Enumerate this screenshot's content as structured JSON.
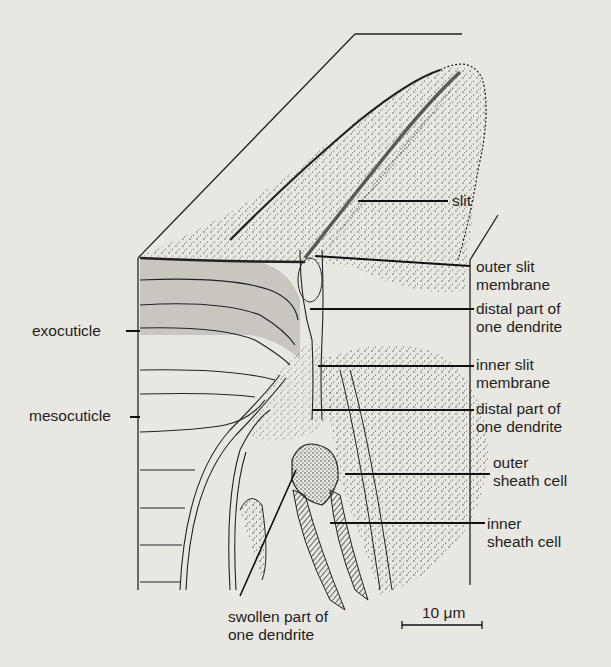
{
  "figure": {
    "colors": {
      "background": "#e9e7e2",
      "ink": "#1e1e1e",
      "exocuticle_fill": "#c9c6c0",
      "stipple": "#2a2a2a"
    }
  },
  "labels": {
    "slit": "slit",
    "outer_slit_membrane": "outer slit\nmembrane",
    "distal_part_1": "distal part of\none dendrite",
    "inner_slit_membrane": "inner slit\nmembrane",
    "distal_part_2": "distal part of\none dendrite",
    "outer_sheath_cell": "outer\nsheath cell",
    "inner_sheath_cell": "inner\nsheath cell",
    "exocuticle": "exocuticle",
    "mesocuticle": "mesocuticle",
    "swollen_part": "swollen part of\none dendrite"
  },
  "scale_bar": {
    "label": "10 μm",
    "value": 10,
    "unit": "μm"
  }
}
